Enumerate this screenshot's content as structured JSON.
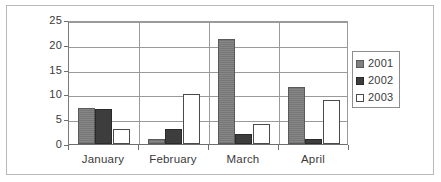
{
  "chart_data": {
    "type": "bar",
    "title": "",
    "xlabel": "",
    "ylabel": "",
    "categories": [
      "January",
      "February",
      "March",
      "April"
    ],
    "series": [
      {
        "name": "2001",
        "color": "#808080",
        "values": [
          7.3,
          1.0,
          21.2,
          11.5
        ]
      },
      {
        "name": "2002",
        "color": "#3d3d3d",
        "values": [
          7.0,
          3.0,
          2.0,
          1.0
        ]
      },
      {
        "name": "2003",
        "color": "#ffffff",
        "values": [
          3.0,
          10.0,
          4.0,
          8.8
        ]
      }
    ],
    "ylim": [
      0,
      25
    ],
    "yticks": [
      0,
      5,
      10,
      15,
      20,
      25
    ],
    "ytick_labels": [
      "0",
      "5",
      "10",
      "15",
      "20",
      "25"
    ],
    "grid": true,
    "legend_position": "right"
  },
  "legend": {
    "entries": [
      {
        "label": "2001",
        "swatch": "gray-filled-swatch"
      },
      {
        "label": "2002",
        "swatch": "dark-filled-swatch"
      },
      {
        "label": "2003",
        "swatch": "white-outlined-swatch"
      }
    ]
  }
}
